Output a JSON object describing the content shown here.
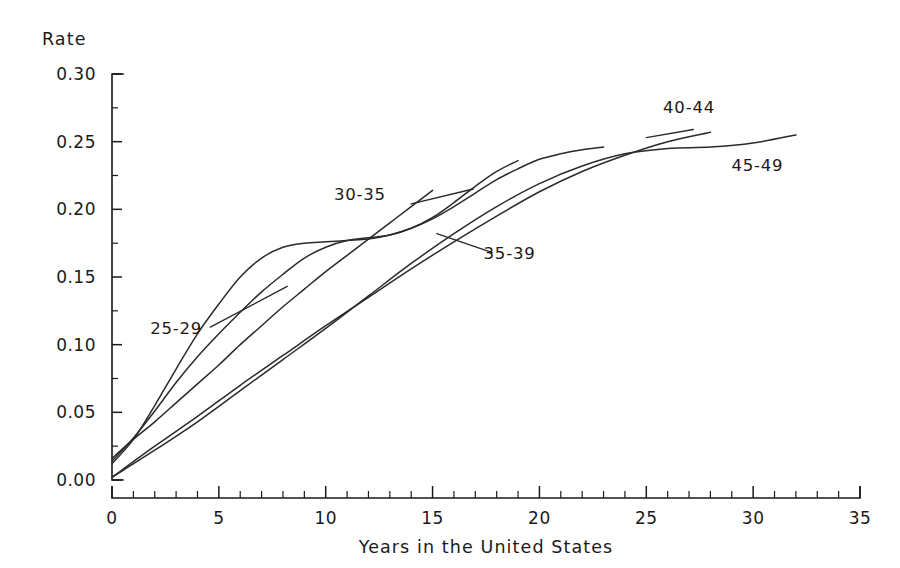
{
  "chart_data": {
    "type": "line",
    "title": "",
    "subtitle": "",
    "xlabel": "Years in the United States",
    "ylabel": "Rate",
    "xlim": [
      0,
      35
    ],
    "ylim": [
      0.0,
      0.3
    ],
    "grid": false,
    "legend_position": "inline-annotations",
    "x_ticks": [
      "0",
      "5",
      "10",
      "15",
      "20",
      "25",
      "30",
      "35"
    ],
    "x_tick_values": [
      0,
      5,
      10,
      15,
      20,
      25,
      30,
      35
    ],
    "x_minor_step": 1,
    "y_ticks": [
      "0.00",
      "0.05",
      "0.10",
      "0.15",
      "0.20",
      "0.25",
      "0.30"
    ],
    "y_tick_values": [
      0.0,
      0.05,
      0.1,
      0.15,
      0.2,
      0.25,
      0.3
    ],
    "y_minor_step": 0.025,
    "series": [
      {
        "name": "25-29",
        "label": "25-29",
        "label_x": 3.0,
        "label_y": 0.108,
        "leader": [
          [
            4.6,
            0.113
          ],
          [
            8.2,
            0.143
          ]
        ],
        "x": [
          0,
          1,
          2,
          3,
          4,
          5,
          6,
          7,
          8,
          9,
          10,
          11,
          12,
          13,
          14,
          15,
          16,
          17,
          18,
          19,
          20,
          21,
          22,
          23
        ],
        "values": [
          0.012,
          0.03,
          0.055,
          0.082,
          0.108,
          0.13,
          0.15,
          0.164,
          0.172,
          0.175,
          0.176,
          0.177,
          0.178,
          0.181,
          0.186,
          0.193,
          0.202,
          0.212,
          0.222,
          0.23,
          0.237,
          0.241,
          0.244,
          0.246
        ]
      },
      {
        "name": "30-35",
        "label": "30-35",
        "label_x": 11.6,
        "label_y": 0.207,
        "leader": [
          [
            14.0,
            0.204
          ],
          [
            16.9,
            0.215
          ]
        ],
        "x": [
          0,
          1,
          2,
          3,
          4,
          5,
          6,
          7,
          8,
          9,
          10,
          11,
          12,
          13,
          14,
          15
        ],
        "values": [
          0.016,
          0.03,
          0.043,
          0.057,
          0.071,
          0.085,
          0.1,
          0.114,
          0.128,
          0.141,
          0.154,
          0.166,
          0.178,
          0.19,
          0.202,
          0.214
        ]
      },
      {
        "name": "35-39",
        "label": "35-39",
        "label_x": 18.6,
        "label_y": 0.163,
        "leader": [
          [
            15.2,
            0.182
          ],
          [
            17.8,
            0.168
          ]
        ],
        "x": [
          0,
          1,
          2,
          3,
          4,
          5,
          6,
          7,
          8,
          9,
          10,
          11,
          12,
          13,
          14,
          15,
          16,
          17,
          18,
          19
        ],
        "values": [
          0.014,
          0.031,
          0.051,
          0.072,
          0.091,
          0.108,
          0.124,
          0.139,
          0.152,
          0.164,
          0.172,
          0.177,
          0.179,
          0.181,
          0.186,
          0.194,
          0.205,
          0.217,
          0.228,
          0.236
        ]
      },
      {
        "name": "40-44",
        "label": "40-44",
        "label_x": 27.0,
        "label_y": 0.271,
        "leader": [
          [
            25.0,
            0.253
          ],
          [
            27.2,
            0.259
          ]
        ],
        "x": [
          0,
          2,
          4,
          6,
          8,
          10,
          12,
          14,
          16,
          18,
          20,
          22,
          24,
          26,
          28
        ],
        "values": [
          0.002,
          0.025,
          0.047,
          0.07,
          0.092,
          0.114,
          0.135,
          0.156,
          0.176,
          0.195,
          0.213,
          0.228,
          0.24,
          0.25,
          0.257
        ]
      },
      {
        "name": "45-49",
        "label": "45-49",
        "label_x": 30.2,
        "label_y": 0.228,
        "leader": null,
        "x": [
          0,
          2,
          4,
          6,
          8,
          10,
          12,
          14,
          16,
          18,
          20,
          22,
          24,
          26,
          28,
          30,
          32
        ],
        "values": [
          0.002,
          0.022,
          0.043,
          0.066,
          0.089,
          0.112,
          0.136,
          0.16,
          0.182,
          0.202,
          0.219,
          0.232,
          0.241,
          0.245,
          0.246,
          0.249,
          0.255
        ]
      }
    ],
    "annotations": [
      {
        "text": "25-29",
        "note": "earliest-arrival-age group, plateaus near 0.175 between years 9 and 12"
      },
      {
        "text": "30-35",
        "note": "near-linear rise, truncated at 15 years"
      },
      {
        "text": "35-39",
        "note": "S-shaped, shoulder near 0.18 around years 11-13"
      },
      {
        "text": "40-44",
        "note": "steady rise to 0.257 at 28 years"
      },
      {
        "text": "45-49",
        "note": "slowest early rise, reaches 0.255 at 32 years"
      }
    ]
  },
  "colors": {
    "curve": "#2a2a2a",
    "axis": "#1a1a1a",
    "background": "#ffffff"
  }
}
